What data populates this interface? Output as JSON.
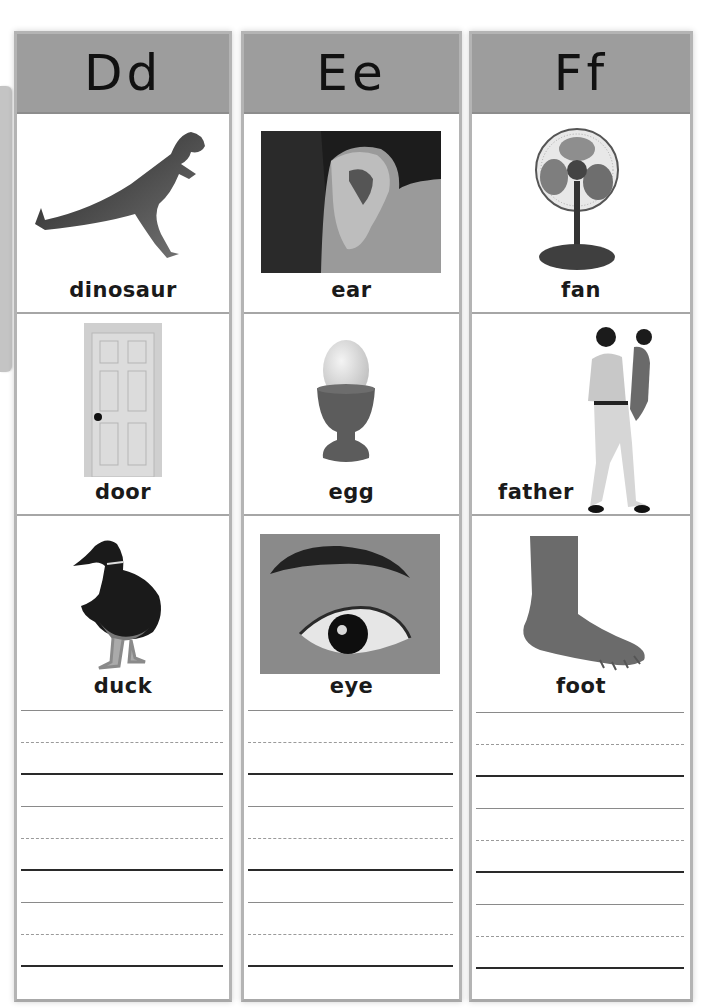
{
  "page": {
    "side_tab": "tab",
    "colors": {
      "header_bg": "#9d9d9d",
      "border": "#b4b4b4",
      "side_tab": "#c4c4c4"
    }
  },
  "columns": [
    {
      "letter": "Dd",
      "items": [
        {
          "word": "dinosaur",
          "picture": "dinosaur-toy"
        },
        {
          "word": "door",
          "picture": "white-panel-door"
        },
        {
          "word": "duck",
          "picture": "mallard-duck"
        }
      ],
      "writing_lines": 3
    },
    {
      "letter": "Ee",
      "items": [
        {
          "word": "ear",
          "picture": "ear-photo"
        },
        {
          "word": "egg",
          "picture": "egg-in-cup"
        },
        {
          "word": "eye",
          "picture": "eye-photo"
        }
      ],
      "writing_lines": 3
    },
    {
      "letter": "Ff",
      "items": [
        {
          "word": "fan",
          "picture": "desk-fan"
        },
        {
          "word": "father",
          "picture": "father-holding-child"
        },
        {
          "word": "foot",
          "picture": "bare-foot"
        }
      ],
      "writing_lines": 3
    }
  ]
}
